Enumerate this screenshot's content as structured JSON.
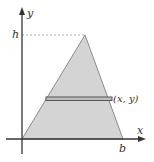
{
  "figure": {
    "labels": {
      "y_axis": "y",
      "x_axis": "x",
      "height": "h",
      "base": "b",
      "point": "(x, y)"
    },
    "colors": {
      "fill": "#d4d4d4",
      "edge": "#8a8a8a",
      "axis": "#333333",
      "strip": "#555555",
      "dashed": "#999999"
    }
  }
}
